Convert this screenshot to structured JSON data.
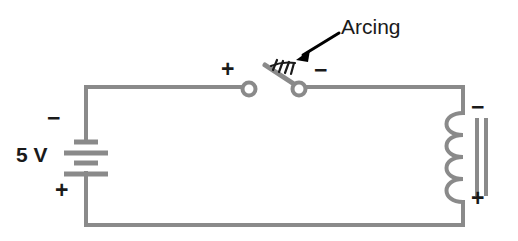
{
  "diagram": {
    "type": "electrical-schematic",
    "canvas": {
      "width": 518,
      "height": 241
    },
    "colors": {
      "wire": "#8a8a8a",
      "label_text": "#1a1a1a",
      "arc_marks": "#1a1a1a",
      "arrow": "#000000",
      "background": "#ffffff"
    },
    "labels": {
      "source_value": "5 V",
      "battery_negative": "−",
      "battery_positive": "+",
      "switch_left_polarity": "+",
      "switch_right_polarity": "−",
      "coil_negative": "−",
      "coil_positive": "+",
      "callout": "Arcing"
    },
    "components": [
      {
        "name": "battery",
        "kind": "dc-voltage-source",
        "value": "5 V",
        "plate_count": 4,
        "terminals": {
          "top": "−",
          "bottom": "+"
        }
      },
      {
        "name": "switch",
        "kind": "knife-switch-opening",
        "state": "opening",
        "terminal_count": 2,
        "arc_mark_count": 4,
        "terminals": {
          "left": "+",
          "right": "−"
        }
      },
      {
        "name": "inductor",
        "kind": "iron-core-coil",
        "loop_count": 4,
        "core_bar_count": 2,
        "terminals": {
          "top": "−",
          "bottom": "+"
        }
      }
    ],
    "annotation": {
      "text": "Arcing",
      "arrow": {
        "from_x": 340,
        "from_y": 34,
        "to_x": 296,
        "to_y": 59
      }
    }
  }
}
